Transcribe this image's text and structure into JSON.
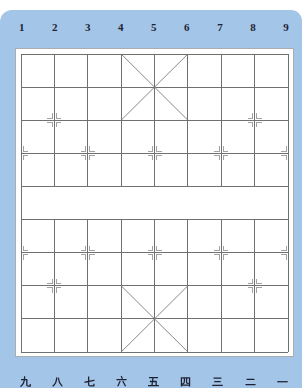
{
  "board": {
    "files": 9,
    "ranks": 10,
    "top_file_labels": [
      "1",
      "2",
      "3",
      "4",
      "5",
      "6",
      "7",
      "8",
      "9"
    ],
    "bottom_file_labels": [
      "九",
      "八",
      "七",
      "六",
      "五",
      "四",
      "三",
      "二",
      "一"
    ],
    "river_after_rank": 4,
    "palaces": [
      {
        "top_rank": 0,
        "left_file": 3
      },
      {
        "top_rank": 7,
        "left_file": 3
      }
    ],
    "point_markers": [
      [
        1,
        2
      ],
      [
        7,
        2
      ],
      [
        0,
        3
      ],
      [
        2,
        3
      ],
      [
        4,
        3
      ],
      [
        6,
        3
      ],
      [
        8,
        3
      ],
      [
        0,
        6
      ],
      [
        2,
        6
      ],
      [
        4,
        6
      ],
      [
        6,
        6
      ],
      [
        8,
        6
      ],
      [
        1,
        7
      ],
      [
        7,
        7
      ]
    ],
    "colors": {
      "frame": "#a3c5e8",
      "board": "#ffffff",
      "grid": "#707070",
      "palace": "#7a7a7a",
      "marker": "#a2a2a2",
      "label": "#1f2233"
    }
  }
}
